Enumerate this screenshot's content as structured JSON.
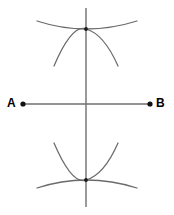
{
  "figure": {
    "canvas": {
      "width": 174,
      "height": 215,
      "background": "#ffffff"
    },
    "colors": {
      "line": "#6f6f6f",
      "arc": "#6a6a6a",
      "dot": "#101010",
      "label": "#000000"
    }
  },
  "labels": {
    "point_a": "A",
    "point_b": "B"
  },
  "points": {
    "a": {
      "name": "A",
      "x": 23,
      "y": 104,
      "radius": 2.6
    },
    "b": {
      "name": "B",
      "x": 150,
      "y": 104,
      "radius": 2.6
    },
    "midpoint": {
      "name": "M",
      "x": 86,
      "y": 104
    },
    "upper_intersection": {
      "name": "P",
      "x": 86,
      "y": 29,
      "radius": 1.9
    },
    "lower_intersection": {
      "name": "Q",
      "x": 86,
      "y": 180,
      "radius": 1.9
    }
  },
  "segment_ab": {
    "name": "segment-ab",
    "x1": 23,
    "y1": 104,
    "x2": 150,
    "y2": 104
  },
  "bisector_line": {
    "name": "perpendicular-bisector",
    "x1": 86,
    "y1": 8,
    "x2": 86,
    "y2": 207
  },
  "arcs": [
    {
      "name": "arc-from-a-upper-wide",
      "path": "M 37 21 Q 86 37 137 21",
      "description": "wide shallow arc passing through upper intersection, opening downward"
    },
    {
      "name": "arc-from-b-upper-steep",
      "path": "M 54 66 Q 72 24 86 29 Q 104 34 118 66",
      "description": "steeper arc crossing the wide arc at the upper intersection"
    },
    {
      "name": "arc-from-a-lower-wide",
      "path": "M 37 188 Q 86 172 137 188",
      "description": "wide shallow arc passing through lower intersection, opening upward"
    },
    {
      "name": "arc-from-b-lower-steep",
      "path": "M 54 143 Q 72 185 86 180 Q 104 175 118 143",
      "description": "steeper arc crossing the wide arc at the lower intersection"
    }
  ]
}
